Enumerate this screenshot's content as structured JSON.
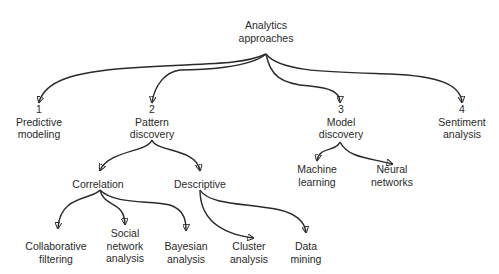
{
  "diagram": {
    "type": "tree",
    "root": {
      "id": "root",
      "lines": [
        "Analytics",
        "approaches"
      ]
    },
    "nodes": [
      {
        "id": "n1",
        "lines": [
          "1",
          "Predictive",
          "modeling"
        ],
        "parent": "root"
      },
      {
        "id": "n2",
        "lines": [
          "2",
          "Pattern",
          "discovery"
        ],
        "parent": "root"
      },
      {
        "id": "n3",
        "lines": [
          "3",
          "Model",
          "discovery"
        ],
        "parent": "root"
      },
      {
        "id": "n4",
        "lines": [
          "4",
          "Sentiment",
          "analysis"
        ],
        "parent": "root"
      },
      {
        "id": "corr",
        "lines": [
          "Correlation"
        ],
        "parent": "n2"
      },
      {
        "id": "desc",
        "lines": [
          "Descriptive"
        ],
        "parent": "n2"
      },
      {
        "id": "ml",
        "lines": [
          "Machine",
          "learning"
        ],
        "parent": "n3"
      },
      {
        "id": "nn",
        "lines": [
          "Neural",
          "networks"
        ],
        "parent": "n3"
      },
      {
        "id": "cf",
        "lines": [
          "Collaborative",
          "filtering"
        ],
        "parent": "corr"
      },
      {
        "id": "sna",
        "lines": [
          "Social",
          "network",
          "analysis"
        ],
        "parent": "corr"
      },
      {
        "id": "ba",
        "lines": [
          "Bayesian",
          "analysis"
        ],
        "parent": "corr"
      },
      {
        "id": "ca",
        "lines": [
          "Cluster",
          "analysis"
        ],
        "parent": "desc"
      },
      {
        "id": "dm",
        "lines": [
          "Data",
          "mining"
        ],
        "parent": "desc"
      }
    ]
  },
  "colors": {
    "line": "#2a2a2a",
    "text": "#2a2a2a",
    "background": "#ffffff"
  }
}
